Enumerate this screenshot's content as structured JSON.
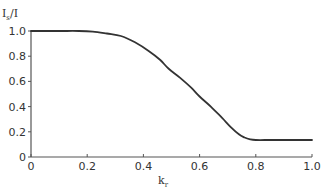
{
  "chart_data": {
    "type": "line",
    "title": "",
    "xlabel": "k_r",
    "xlabel_main": "k",
    "xlabel_sub": "r",
    "ylabel": "I_s/I",
    "ylabel_main": "I",
    "ylabel_sub": "s",
    "ylabel_tail": "/I",
    "xlim": [
      0,
      1.0
    ],
    "ylim": [
      0,
      1.0
    ],
    "grid": false,
    "legend": null,
    "x_ticks": [
      "0",
      "0.2",
      "0.4",
      "0.6",
      "0.8",
      "1.0"
    ],
    "y_ticks": [
      "0",
      "0.2",
      "0.4",
      "0.6",
      "0.8",
      "1.0"
    ],
    "series": [
      {
        "name": "I_s/I",
        "color": "#333333",
        "x": [
          0.0,
          0.1,
          0.17,
          0.22,
          0.27,
          0.32,
          0.37,
          0.42,
          0.46,
          0.49,
          0.53,
          0.57,
          0.6,
          0.64,
          0.68,
          0.71,
          0.74,
          0.76,
          0.78,
          0.8,
          0.85,
          0.9,
          1.0
        ],
        "y": [
          1.0,
          1.0,
          1.0,
          0.995,
          0.98,
          0.96,
          0.91,
          0.84,
          0.77,
          0.7,
          0.63,
          0.55,
          0.48,
          0.4,
          0.31,
          0.24,
          0.18,
          0.155,
          0.14,
          0.135,
          0.135,
          0.135,
          0.135
        ]
      }
    ]
  }
}
